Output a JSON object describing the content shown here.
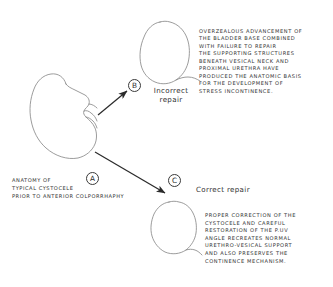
{
  "figure": {
    "background_color": "#ffffff",
    "ink_color": "#3a3a3a"
  },
  "markers": {
    "a": "A",
    "b": "B",
    "c": "C"
  },
  "caption_a": {
    "lines": [
      "ANATOMY OF",
      "TYPICAL CYSTOCELE",
      "PRIOR TO ANTERIOR COLPORRHAPHY"
    ]
  },
  "label_incorrect": {
    "lines": [
      "Incorrect",
      "repair"
    ]
  },
  "label_correct": {
    "text": "Correct repair"
  },
  "block_b": {
    "lines": [
      "OVERZEALOUS ADVANCEMENT OF",
      "THE BLADDER BASE COMBINED",
      "WITH FAILURE TO REPAIR",
      "THE SUPPORTING STRUCTURES",
      "BENEATH VESICAL NECK AND",
      "PROXIMAL URETHRA HAVE",
      "PRODUCED THE ANATOMIC BASIS",
      "FOR THE DEVELOPMENT OF",
      "STRESS INCONTINENCE."
    ]
  },
  "block_c": {
    "lines": [
      "PROPER CORRECTION OF THE",
      "CYSTOCELE AND CAREFUL",
      "RESTORATION OF THE P.UV",
      "ANGLE RECREATES NORMAL",
      "URETHRO-VESICAL SUPPORT",
      "AND ALSO PRESERVES THE",
      "CONTINENCE MECHANISM."
    ]
  }
}
